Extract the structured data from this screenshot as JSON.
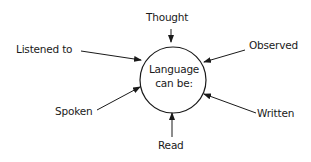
{
  "center": {
    "line1": "Language",
    "line2": "can be:"
  },
  "labels": {
    "thought": "Thought",
    "observed": "Observed",
    "written": "Written",
    "read": "Read",
    "spoken": "Spoken",
    "listened_to": "Listened to"
  },
  "colors": {
    "stroke": "#1a1a1a",
    "background": "#ffffff"
  }
}
